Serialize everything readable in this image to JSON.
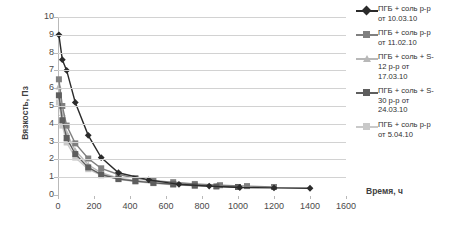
{
  "chart_data": {
    "type": "line",
    "title": "",
    "xlabel": "Время, ч",
    "ylabel": "Вязкость, Пз",
    "xlim": [
      0,
      1600
    ],
    "ylim": [
      0,
      10
    ],
    "xticks": [
      "0",
      "200",
      "400",
      "600",
      "800",
      "1000",
      "1200",
      "1400",
      "1600"
    ],
    "yticks": [
      "0",
      "1",
      "2",
      "3",
      "4",
      "5",
      "6",
      "7",
      "8",
      "9",
      "10"
    ],
    "grid": "horizontal",
    "legend_position": "right",
    "series": [
      {
        "name": "ПГБ + соль р-р от 10.03.10",
        "label_line1": "ПГБ + соль р-р",
        "label_line2": "от 10.03.10",
        "color": "#2b2b2b",
        "marker": "diamond",
        "x": [
          5,
          24,
          48,
          96,
          168,
          240,
          336,
          504,
          672,
          840,
          1010,
          1200,
          1400
        ],
        "y": [
          9.0,
          7.6,
          7.0,
          5.2,
          3.35,
          2.1,
          1.25,
          0.85,
          0.6,
          0.5,
          0.42,
          0.4,
          0.38
        ]
      },
      {
        "name": "ПГБ + соль р-р от 11.02.10",
        "label_line1": "ПГБ + соль р-р",
        "label_line2": "от 11.02.10",
        "color": "#808080",
        "marker": "square",
        "x": [
          5,
          24,
          48,
          96,
          168,
          240,
          336,
          430,
          530,
          640,
          760,
          900,
          1050,
          1200
        ],
        "y": [
          6.5,
          5.0,
          3.9,
          2.9,
          2.05,
          1.5,
          1.15,
          0.95,
          0.8,
          0.72,
          0.62,
          0.55,
          0.5,
          0.45
        ]
      },
      {
        "name": "ПГБ + соль + S-12 р-р от 17.03.10",
        "label_line1": "ПГБ + соль + S-",
        "label_line2": "12 р-р от",
        "label_line3": "17.03.10",
        "color": "#b8b8b8",
        "marker": "triangle",
        "x": [
          5,
          24,
          48,
          96,
          168,
          240,
          336,
          430,
          530,
          640,
          760,
          880
        ],
        "y": [
          6.1,
          4.6,
          3.5,
          2.5,
          1.7,
          1.25,
          0.95,
          0.82,
          0.7,
          0.62,
          0.55,
          0.5
        ]
      },
      {
        "name": "ПГБ + соль + S-30 р-р от 24.03.10",
        "label_line1": "ПГБ + соль + S-",
        "label_line2": "30 р-р от",
        "label_line3": "24.03.10",
        "color": "#5e5e5e",
        "marker": "square",
        "x": [
          5,
          24,
          48,
          96,
          168,
          240,
          336,
          430,
          530,
          640,
          760,
          880,
          1000
        ],
        "y": [
          5.6,
          4.2,
          3.2,
          2.3,
          1.55,
          1.15,
          0.9,
          0.78,
          0.68,
          0.6,
          0.53,
          0.48,
          0.45
        ]
      },
      {
        "name": "ПГБ + соль р-р от 5.04.10",
        "label_line1": "ПГБ + соль р-р",
        "label_line2": "от 5.04.10",
        "color": "#c9c9c9",
        "marker": "square",
        "x": [
          5,
          24,
          48,
          96,
          168,
          240,
          336,
          430,
          530,
          640,
          760
        ],
        "y": [
          5.2,
          3.9,
          2.95,
          2.1,
          1.45,
          1.1,
          0.88,
          0.75,
          0.66,
          0.58,
          0.52
        ]
      }
    ]
  }
}
